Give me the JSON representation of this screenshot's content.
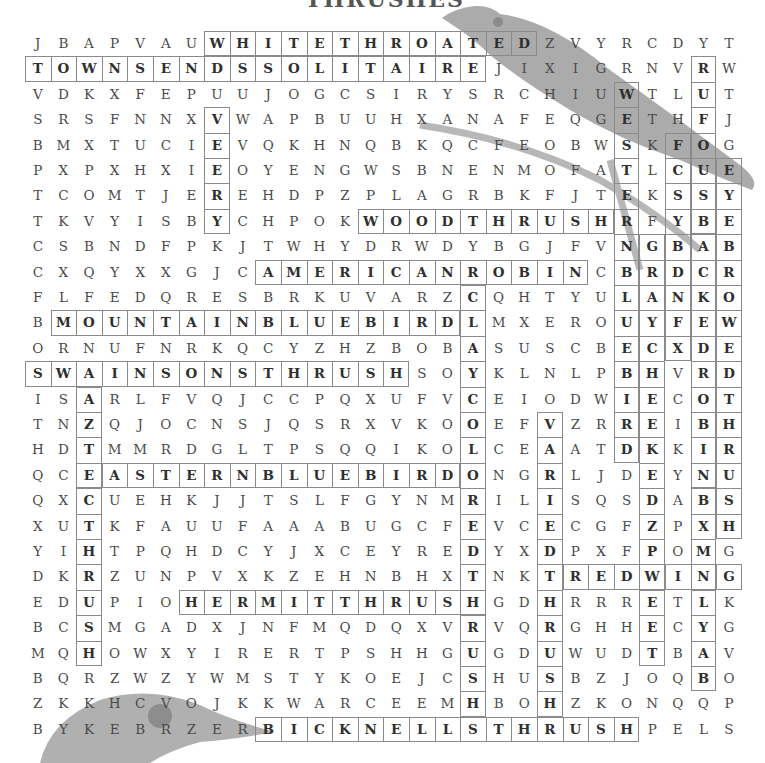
{
  "title": "THRUSHES",
  "grid": {
    "rows": 28,
    "cols": 28,
    "letters": [
      "JBAPVAUWHITETHROATEDZVYRCDYT",
      "TOWNSENDSSOLITAIREJIXIGRNVRW",
      "VDKXFEPUUJOGCSIRYSRCHIUWTLUT",
      "SRSFNNXVWAPBUUHXANAFEQGETHFJ",
      "BMXTUCIEVQKHNQBKQCFEOBWSKFOG",
      "PXPXHXIEOYENGWSBNENMOFATLCUE",
      "TCOMTJEREHDPZPLAGRBKFJTEKSSY",
      "TKVYISBYCHPOKWOODTHRUSHRFYBE",
      "CSBNDFPKJTWHYDRWDYBGJFVNGBAB",
      "CXQYXXGJCAMERICANROBINCBRDCR",
      "FLFEDQRESBRKUVARZCQHTYULANKO",
      "BMOUNTAINBLUEBIRDLMXEROUYFEW",
      "ORNUFNRKQCYZHZBOBASUSCBECXDE",
      "SWAINSONSTHRUSHSOYKLNLPBHVRD",
      "ISARLFVQJCCPQXUFVCEIODWIECOT",
      "TNZQJOCNSJQSRXVKOOEFVZRREIBH",
      "HDTMMRDGLTPSQQIKOLCEAATDKKIR",
      "QCEASTERNBLUEBIRDONGRLJDEYNU",
      "QXCUEHKJJTSLFGYNMRILISQSDABS",
      "XUTKFAUUFAAABUGCFEVCECGFZPXH",
      "YIHTPQHDCYJXCEYREDYXDPXFPOMG",
      "DKRZUNPVXKZEHNBHXTNKTREDWING",
      "EDUPIOHERMITTHRUSHGDHRRRETLK",
      "BCSMGADXJNFMQDQXVRVQRGHHECYG",
      "MQHOWXYIRERTPSHHGUGDUWUDTBAV",
      "BQRZWZYWMSTYKOEJCSHUSBZJOQBO",
      "ZKKHCVOJKKWARCEEMHBOHZKONQQP",
      "BYKEBRZERBICKNELLSTHRUSHPELS"
    ]
  },
  "found_words": [
    {
      "word": "WHITETHROATED",
      "start": [
        0,
        7
      ],
      "dir": "across"
    },
    {
      "word": "TOWNSENDSSOLITAIRE",
      "start": [
        1,
        0
      ],
      "dir": "across"
    },
    {
      "word": "VEERY",
      "start": [
        3,
        7
      ],
      "dir": "down"
    },
    {
      "word": "WOODTHRUSH",
      "start": [
        7,
        13
      ],
      "dir": "across"
    },
    {
      "word": "AMERICANROBIN",
      "start": [
        9,
        9
      ],
      "dir": "across"
    },
    {
      "word": "MOUNTAINBLUEBIRD",
      "start": [
        11,
        1
      ],
      "dir": "across"
    },
    {
      "word": "SWAINSONSTHRUSH",
      "start": [
        13,
        0
      ],
      "dir": "across"
    },
    {
      "word": "EASTERNBLUEBIRD",
      "start": [
        17,
        2
      ],
      "dir": "across"
    },
    {
      "word": "HERMITTHRUSH",
      "start": [
        22,
        6
      ],
      "dir": "across"
    },
    {
      "word": "BICKNELLSTHRUSH",
      "start": [
        27,
        9
      ],
      "dir": "across"
    },
    {
      "word": "REDWING",
      "start": [
        21,
        21
      ],
      "dir": "across"
    },
    {
      "word": "AZTECTHRUSH",
      "start": [
        14,
        2
      ],
      "dir": "down"
    },
    {
      "word": "CLAYCOLOREDTHRUSH",
      "start": [
        10,
        17
      ],
      "dir": "down"
    },
    {
      "word": "VARIEDTHRUSH",
      "start": [
        15,
        20
      ],
      "dir": "down"
    },
    {
      "word": "RUFOUSBACKEDROBIN",
      "start": [
        1,
        26
      ],
      "dir": "down"
    },
    {
      "word": "WESTERNBLUEBIRD",
      "start": [
        2,
        23
      ],
      "dir": "down"
    },
    {
      "word": "FIELDFARE",
      "start": [
        4,
        25
      ],
      "dir": "down"
    },
    {
      "word": "GRAYCHEEKEDTHRUSH",
      "start": [
        8,
        24
      ],
      "dir": "down"
    },
    {
      "word": "REDWING",
      "start": [
        1,
        26
      ],
      "dir": "down"
    },
    {
      "word": "EYEBROWEDTHRUSH",
      "start": [
        5,
        27
      ],
      "dir": "down"
    },
    {
      "word": "BROWNNECKED",
      "start": [
        15,
        26
      ],
      "dir": "down"
    }
  ],
  "colors": {
    "letter": "#4a4a4a",
    "found_letter": "#2f2f2f",
    "box_border": "#8a8a8a",
    "illustration": "#9a9a9a"
  }
}
